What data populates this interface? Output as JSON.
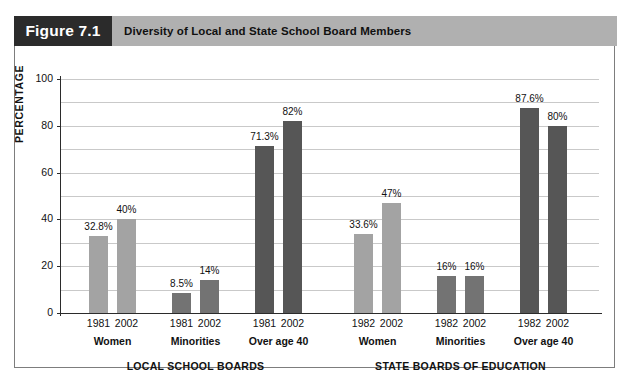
{
  "figure": {
    "tag": "Figure 7.1",
    "title": "Diversity of Local and State School Board Members",
    "tag_bg": "#2b2b2b",
    "title_bg": "#b0b0b0"
  },
  "chart_data": {
    "type": "bar",
    "title": "Diversity of Local and State School Board Members",
    "xlabel": "",
    "ylabel": "PERCENTAGE",
    "ylim": [
      0,
      100
    ],
    "yticks": [
      0,
      20,
      40,
      60,
      80,
      100
    ],
    "ytick_labels": [
      "0",
      "20",
      "40",
      "60",
      "80",
      "100"
    ],
    "minor_gridlines": [
      10,
      30,
      50,
      70,
      90
    ],
    "grid": true,
    "legend": "none",
    "panels": [
      {
        "name": "LOCAL SCHOOL BOARDS",
        "groups": [
          {
            "label": "Women",
            "color": "#a3a3a3",
            "bars": [
              {
                "year": "1981",
                "value": 32.8,
                "label": "32.8%"
              },
              {
                "year": "2002",
                "value": 40,
                "label": "40%"
              }
            ]
          },
          {
            "label": "Minorities",
            "color": "#737373",
            "bars": [
              {
                "year": "1981",
                "value": 8.5,
                "label": "8.5%"
              },
              {
                "year": "2002",
                "value": 14,
                "label": "14%"
              }
            ]
          },
          {
            "label": "Over age 40",
            "color": "#565656",
            "bars": [
              {
                "year": "1981",
                "value": 71.3,
                "label": "71.3%"
              },
              {
                "year": "2002",
                "value": 82,
                "label": "82%"
              }
            ]
          }
        ]
      },
      {
        "name": "STATE BOARDS OF EDUCATION",
        "groups": [
          {
            "label": "Women",
            "color": "#a3a3a3",
            "bars": [
              {
                "year": "1982",
                "value": 33.6,
                "label": "33.6%"
              },
              {
                "year": "2002",
                "value": 47,
                "label": "47%"
              }
            ]
          },
          {
            "label": "Minorities",
            "color": "#737373",
            "bars": [
              {
                "year": "1982",
                "value": 16,
                "label": "16%"
              },
              {
                "year": "2002",
                "value": 16,
                "label": "16%"
              }
            ]
          },
          {
            "label": "Over age 40",
            "color": "#565656",
            "bars": [
              {
                "year": "1982",
                "value": 87.6,
                "label": "87.6%"
              },
              {
                "year": "2002",
                "value": 80,
                "label": "80%"
              }
            ]
          }
        ]
      }
    ]
  }
}
